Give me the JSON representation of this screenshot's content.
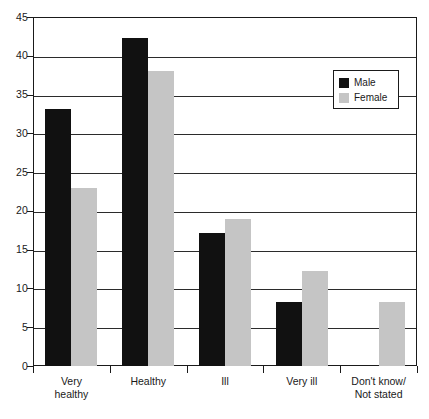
{
  "chart_data": {
    "type": "bar",
    "title": "",
    "subtitle": "",
    "xlabel": "",
    "ylabel": "",
    "categories": [
      "Very healthy",
      "Healthy",
      "Ill",
      "Very ill",
      "Don't know/ Not stated"
    ],
    "category_lines": [
      [
        "Very",
        "healthy"
      ],
      [
        "Healthy"
      ],
      [
        "Ill"
      ],
      [
        "Very ill"
      ],
      [
        "Don't know/",
        "Not stated"
      ]
    ],
    "series": [
      {
        "name": "Male",
        "color": "#111111",
        "values": [
          33.2,
          42.3,
          17.2,
          8.3,
          0
        ]
      },
      {
        "name": "Female",
        "color": "#c5c5c5",
        "values": [
          23.0,
          38.0,
          19.0,
          12.2,
          8.2
        ]
      }
    ],
    "ylim": [
      0,
      45
    ],
    "yticks": [
      0,
      5,
      10,
      15,
      20,
      25,
      30,
      35,
      40,
      45
    ],
    "ytick_labels": [
      "0",
      "5",
      "10",
      "15",
      "20",
      "25",
      "30",
      "35",
      "40",
      "45"
    ],
    "grid": true,
    "grid_axis": "y",
    "legend_position": "top-right",
    "legend_entries": [
      "Male",
      "Female"
    ]
  },
  "legend": {
    "male_label": "Male",
    "female_label": "Female"
  }
}
